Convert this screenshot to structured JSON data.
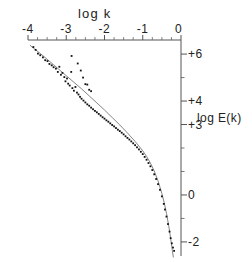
{
  "figure": {
    "xaxis": {
      "title": "log k",
      "position": "top",
      "range": [
        -4,
        0
      ],
      "ticks": [
        -4,
        -3,
        -2,
        -1,
        0
      ],
      "tick_labels": [
        "-4",
        "-3",
        "-2",
        "-1",
        "0"
      ],
      "minor_ticks_between": 3
    },
    "yaxis": {
      "title": "log E(k)",
      "position": "right",
      "range": [
        -2.6,
        6.6
      ],
      "labeled_ticks": [
        6,
        4,
        3,
        0,
        -2
      ],
      "tick_labels": [
        "+6",
        "+4",
        "+3",
        "0",
        "-2"
      ],
      "all_ticks": [
        6,
        5,
        4,
        3,
        2,
        1,
        0,
        -1,
        -2
      ]
    }
  },
  "chart_data": {
    "type": "scatter",
    "title": "",
    "xlabel": "log k",
    "ylabel": "log E(k)",
    "xlim": [
      -4,
      0
    ],
    "ylim": [
      -2.6,
      6.6
    ],
    "grid": false,
    "legend": "none",
    "series": [
      {
        "name": "measured spectrum",
        "type": "scatter",
        "marker": "dot",
        "color": "#111111",
        "points": [
          [
            -3.86,
            6.3
          ],
          [
            -3.8,
            6.18
          ],
          [
            -3.74,
            6.02
          ],
          [
            -3.68,
            5.95
          ],
          [
            -3.61,
            5.86
          ],
          [
            -3.55,
            5.74
          ],
          [
            -3.49,
            5.7
          ],
          [
            -3.44,
            5.58
          ],
          [
            -3.38,
            5.52
          ],
          [
            -3.33,
            5.44
          ],
          [
            -3.27,
            5.38
          ],
          [
            -3.22,
            5.24
          ],
          [
            -3.18,
            5.46
          ],
          [
            -3.14,
            5.12
          ],
          [
            -3.1,
            5.2
          ],
          [
            -3.05,
            5.02
          ],
          [
            -3.02,
            4.84
          ],
          [
            -2.98,
            4.96
          ],
          [
            -2.95,
            4.74
          ],
          [
            -2.91,
            4.66
          ],
          [
            -2.87,
            5.24
          ],
          [
            -2.84,
            4.55
          ],
          [
            -2.8,
            4.44
          ],
          [
            -2.76,
            4.6
          ],
          [
            -2.72,
            4.36
          ],
          [
            -2.68,
            4.28
          ],
          [
            -2.64,
            4.18
          ],
          [
            -2.6,
            4.1
          ],
          [
            -2.86,
            5.92
          ],
          [
            -2.7,
            5.6
          ],
          [
            -2.62,
            5.3
          ],
          [
            -2.56,
            5.0
          ],
          [
            -2.5,
            4.72
          ],
          [
            -2.45,
            4.7
          ],
          [
            -2.4,
            4.48
          ],
          [
            -2.35,
            4.42
          ],
          [
            -2.55,
            4.02
          ],
          [
            -2.5,
            3.94
          ],
          [
            -2.45,
            3.86
          ],
          [
            -2.4,
            3.8
          ],
          [
            -2.35,
            3.72
          ],
          [
            -2.3,
            3.65
          ],
          [
            -2.25,
            3.58
          ],
          [
            -2.2,
            3.52
          ],
          [
            -2.15,
            3.45
          ],
          [
            -2.1,
            3.38
          ],
          [
            -2.05,
            3.31
          ],
          [
            -2.0,
            3.25
          ],
          [
            -1.95,
            3.18
          ],
          [
            -1.9,
            3.12
          ],
          [
            -1.85,
            3.05
          ],
          [
            -1.8,
            2.98
          ],
          [
            -1.75,
            2.92
          ],
          [
            -1.7,
            2.85
          ],
          [
            -1.65,
            2.78
          ],
          [
            -1.6,
            2.72
          ],
          [
            -1.55,
            2.65
          ],
          [
            -1.5,
            2.58
          ],
          [
            -1.45,
            2.5
          ],
          [
            -1.4,
            2.43
          ],
          [
            -1.35,
            2.36
          ],
          [
            -1.3,
            2.28
          ],
          [
            -1.25,
            2.2
          ],
          [
            -1.2,
            2.12
          ],
          [
            -1.15,
            2.03
          ],
          [
            -1.1,
            1.94
          ],
          [
            -1.05,
            1.84
          ],
          [
            -1.0,
            1.74
          ],
          [
            -0.95,
            1.62
          ],
          [
            -0.9,
            1.5
          ],
          [
            -0.85,
            1.36
          ],
          [
            -0.8,
            1.22
          ],
          [
            -0.75,
            1.06
          ],
          [
            -0.7,
            0.88
          ],
          [
            -0.65,
            0.68
          ],
          [
            -0.6,
            0.46
          ],
          [
            -0.55,
            0.22
          ],
          [
            -0.5,
            -0.06
          ],
          [
            -0.45,
            -0.38
          ],
          [
            -0.42,
            -0.62
          ],
          [
            -0.38,
            -0.92
          ],
          [
            -0.34,
            -1.24
          ],
          [
            -0.3,
            -1.56
          ],
          [
            -0.27,
            -1.84
          ],
          [
            -0.24,
            -2.06
          ],
          [
            -0.21,
            -2.24
          ],
          [
            -0.18,
            -2.38
          ]
        ]
      },
      {
        "name": "fitted curve",
        "type": "line",
        "color": "#777777",
        "points": [
          [
            -3.95,
            6.38
          ],
          [
            -3.8,
            6.18
          ],
          [
            -3.6,
            5.92
          ],
          [
            -3.4,
            5.64
          ],
          [
            -3.2,
            5.36
          ],
          [
            -3.0,
            5.08
          ],
          [
            -2.8,
            4.8
          ],
          [
            -2.6,
            4.52
          ],
          [
            -2.4,
            4.22
          ],
          [
            -2.2,
            3.92
          ],
          [
            -2.0,
            3.62
          ],
          [
            -1.8,
            3.3
          ],
          [
            -1.6,
            2.98
          ],
          [
            -1.4,
            2.64
          ],
          [
            -1.2,
            2.28
          ],
          [
            -1.0,
            1.88
          ],
          [
            -0.9,
            1.64
          ],
          [
            -0.8,
            1.36
          ],
          [
            -0.7,
            1.02
          ],
          [
            -0.6,
            0.6
          ],
          [
            -0.5,
            0.06
          ],
          [
            -0.44,
            -0.32
          ],
          [
            -0.38,
            -0.78
          ],
          [
            -0.32,
            -1.32
          ],
          [
            -0.27,
            -1.86
          ],
          [
            -0.23,
            -2.32
          ],
          [
            -0.2,
            -2.66
          ]
        ]
      }
    ]
  }
}
